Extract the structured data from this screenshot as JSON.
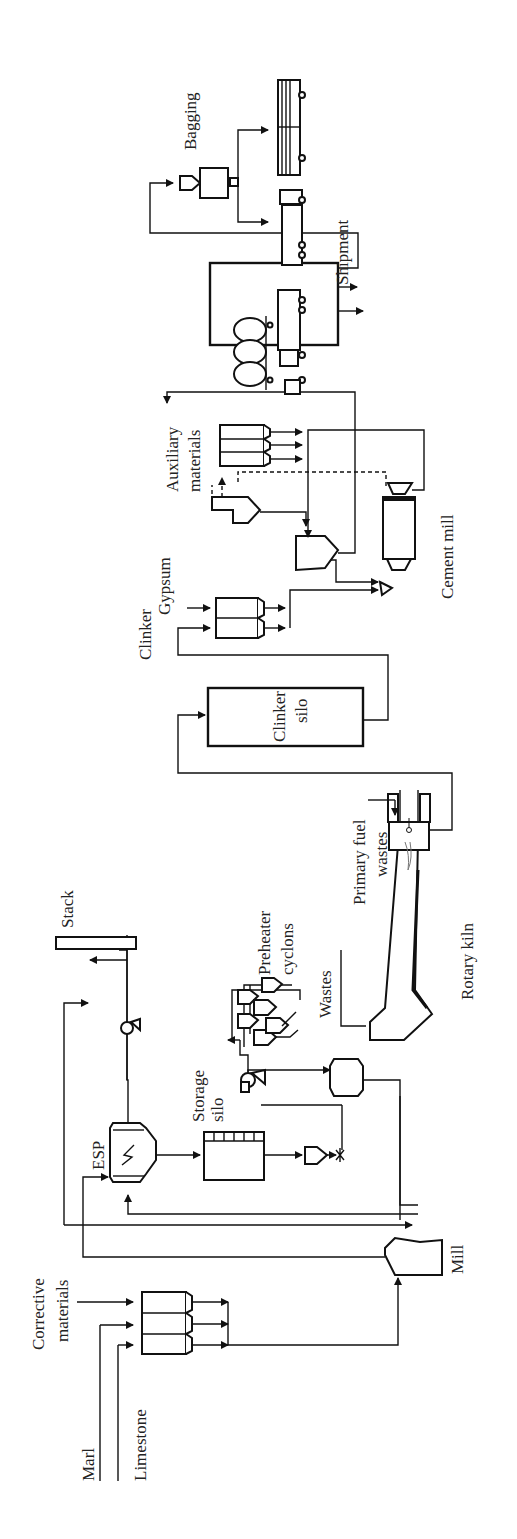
{
  "diagram": {
    "orientation": "rotated-90-ccw",
    "labels": {
      "marl": "Marl",
      "limestone": "Limestone",
      "corrective_1": "Corrective",
      "corrective_2": "materials",
      "mill": "Mill",
      "esp": "ESP",
      "storage_1": "Storage",
      "storage_2": "silo",
      "stack": "Stack",
      "preheater_1": "Preheater",
      "preheater_2": "cyclons",
      "wastes": "Wastes",
      "primary_fuel_1": "Primary fuel",
      "primary_fuel_2": "wastes",
      "rotary_kiln": "Rotary kiln",
      "clinker_silo_1": "Clinker",
      "clinker_silo_2": "silo",
      "clinker": "Clinker",
      "gypsum": "Gypsum",
      "auxiliary_1": "Auxiliary",
      "auxiliary_2": "materials",
      "cement_mill": "Cement mill",
      "bagging": "Bagging",
      "shipment": "Shipment"
    }
  }
}
